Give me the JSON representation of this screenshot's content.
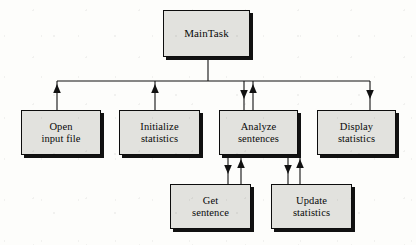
{
  "diagram": {
    "type": "structure-chart",
    "canvas": {
      "width": 416,
      "height": 245
    },
    "style": {
      "box_fill": "#e2e2de",
      "box_border": "#0d0d0d",
      "box_shadow": "#111111",
      "line_color": "#111111",
      "background": "#fdfdfb"
    },
    "nodes": [
      {
        "id": "main-task",
        "label": "MainTask",
        "level": 0,
        "x": 163,
        "y": 10,
        "w": 87,
        "h": 47
      },
      {
        "id": "open-input-file",
        "label": "Open\ninput file",
        "level": 1,
        "x": 21,
        "y": 110,
        "w": 80,
        "h": 45
      },
      {
        "id": "initialize-statistics",
        "label": "Initialize\nstatistics",
        "level": 1,
        "x": 119,
        "y": 110,
        "w": 81,
        "h": 45
      },
      {
        "id": "analyze-sentences",
        "label": "Analyze\nsentences",
        "level": 1,
        "x": 219,
        "y": 110,
        "w": 79,
        "h": 45
      },
      {
        "id": "display-statistics",
        "label": "Display\nstatistics",
        "level": 1,
        "x": 317,
        "y": 110,
        "w": 79,
        "h": 45
      },
      {
        "id": "get-sentence",
        "label": "Get\nsentence",
        "level": 2,
        "x": 170,
        "y": 184,
        "w": 81,
        "h": 45
      },
      {
        "id": "update-statistics",
        "label": "Update\nstatistics",
        "level": 2,
        "x": 271,
        "y": 184,
        "w": 81,
        "h": 45
      }
    ],
    "connections": [
      {
        "from": "main-task",
        "to": "bus",
        "direction": "none"
      },
      {
        "from": "open-input-file",
        "to": "main-task",
        "direction": "up"
      },
      {
        "from": "initialize-statistics",
        "to": "main-task",
        "direction": "up"
      },
      {
        "from": "main-task",
        "to": "analyze-sentences",
        "direction": "down"
      },
      {
        "from": "analyze-sentences",
        "to": "main-task",
        "direction": "up"
      },
      {
        "from": "main-task",
        "to": "display-statistics",
        "direction": "down"
      },
      {
        "from": "analyze-sentences",
        "to": "get-sentence",
        "direction": "down"
      },
      {
        "from": "get-sentence",
        "to": "analyze-sentences",
        "direction": "up"
      },
      {
        "from": "analyze-sentences",
        "to": "update-statistics",
        "direction": "down"
      },
      {
        "from": "update-statistics",
        "to": "analyze-sentences",
        "direction": "up"
      }
    ]
  }
}
